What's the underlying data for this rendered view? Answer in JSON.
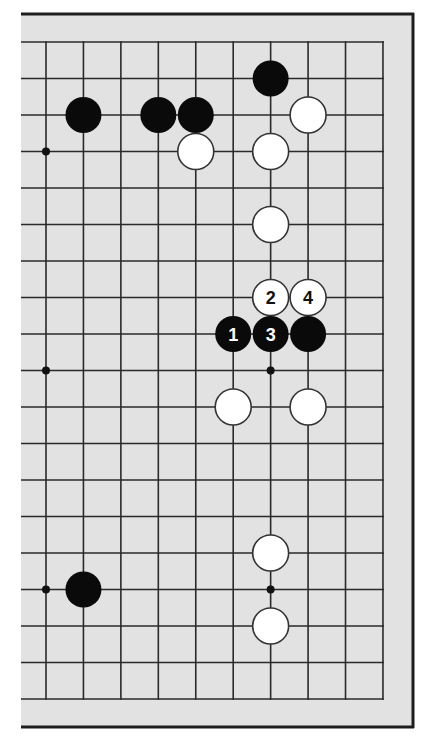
{
  "diagram": {
    "type": "go-board-partial",
    "board_color": "#e2e2e2",
    "frame_color": "#1e1e1e",
    "line_color": "#2a2a2a",
    "columns": 10,
    "rows": 19,
    "edges": {
      "top": true,
      "bottom": true,
      "right": true,
      "left": false
    },
    "star_points": [
      {
        "col": 0,
        "row": 3
      },
      {
        "col": 0,
        "row": 9
      },
      {
        "col": 6,
        "row": 9
      },
      {
        "col": 0,
        "row": 15
      },
      {
        "col": 6,
        "row": 15
      }
    ],
    "stones": [
      {
        "color": "black",
        "col": 1,
        "row": 2,
        "label": ""
      },
      {
        "color": "black",
        "col": 3,
        "row": 2,
        "label": ""
      },
      {
        "color": "black",
        "col": 4,
        "row": 2,
        "label": ""
      },
      {
        "color": "black",
        "col": 6,
        "row": 1,
        "label": ""
      },
      {
        "color": "white",
        "col": 7,
        "row": 2,
        "label": ""
      },
      {
        "color": "white",
        "col": 4,
        "row": 3,
        "label": ""
      },
      {
        "color": "white",
        "col": 6,
        "row": 3,
        "label": ""
      },
      {
        "color": "white",
        "col": 6,
        "row": 5,
        "label": ""
      },
      {
        "color": "white",
        "col": 6,
        "row": 7,
        "label": "2"
      },
      {
        "color": "white",
        "col": 7,
        "row": 7,
        "label": "4"
      },
      {
        "color": "black",
        "col": 5,
        "row": 8,
        "label": "1"
      },
      {
        "color": "black",
        "col": 6,
        "row": 8,
        "label": "3"
      },
      {
        "color": "black",
        "col": 7,
        "row": 8,
        "label": ""
      },
      {
        "color": "white",
        "col": 5,
        "row": 10,
        "label": ""
      },
      {
        "color": "white",
        "col": 7,
        "row": 10,
        "label": ""
      },
      {
        "color": "white",
        "col": 6,
        "row": 14,
        "label": ""
      },
      {
        "color": "black",
        "col": 1,
        "row": 15,
        "label": ""
      },
      {
        "color": "white",
        "col": 6,
        "row": 16,
        "label": ""
      }
    ]
  }
}
